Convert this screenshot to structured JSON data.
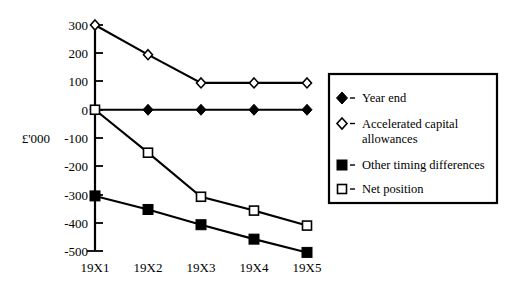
{
  "chart_data": {
    "type": "line",
    "title": "",
    "xlabel": "",
    "ylabel": "£'000",
    "categories": [
      "19X1",
      "19X2",
      "19X3",
      "19X4",
      "19X5"
    ],
    "ylim": [
      -500,
      300
    ],
    "ytick_values": [
      300,
      200,
      100,
      0,
      -100,
      -200,
      -300,
      -400,
      -500
    ],
    "ytick_labels": [
      "300",
      "200",
      "100",
      "0",
      "-100",
      "-200",
      "-300",
      "-400",
      "-500"
    ],
    "grid": false,
    "legend_position": "right",
    "series": [
      {
        "name": "Year end",
        "marker": "filled-diamond",
        "values": [
          0,
          0,
          0,
          0,
          0
        ]
      },
      {
        "name": "Accelerated capital allowances",
        "marker": "open-diamond",
        "values": [
          300,
          195,
          95,
          95,
          95
        ]
      },
      {
        "name": "Other timing differences",
        "marker": "filled-square",
        "values": [
          -305,
          -353,
          -407,
          -458,
          -505
        ]
      },
      {
        "name": "Net position",
        "marker": "open-square",
        "values": [
          0,
          -152,
          -308,
          -357,
          -410
        ]
      }
    ]
  },
  "axis": {
    "y_axis_title": "£'000",
    "tick_300": "300",
    "tick_200": "200",
    "tick_100": "100",
    "tick_0": "0",
    "tick_neg100": "-100",
    "tick_neg200": "-200",
    "tick_neg300": "-300",
    "tick_neg400": "-400",
    "tick_neg500": "-500",
    "x_19X1": "19X1",
    "x_19X2": "19X2",
    "x_19X3": "19X3",
    "x_19X4": "19X4",
    "x_19X5": "19X5"
  },
  "legend": {
    "entries": [
      {
        "label": "Year end",
        "marker": "filled-diamond"
      },
      {
        "label": "Accelerated capital",
        "label2": "allowances",
        "marker": "open-diamond"
      },
      {
        "label": "Other timing differences",
        "marker": "filled-square"
      },
      {
        "label": "Net position",
        "marker": "open-square"
      }
    ],
    "entry_0_label": "Year end",
    "entry_1_label_line1": "Accelerated capital",
    "entry_1_label_line2": "allowances",
    "entry_2_label": "Other timing differences",
    "entry_3_label": "Net position"
  },
  "colors": {
    "foreground": "#000000",
    "background": "#ffffff"
  }
}
